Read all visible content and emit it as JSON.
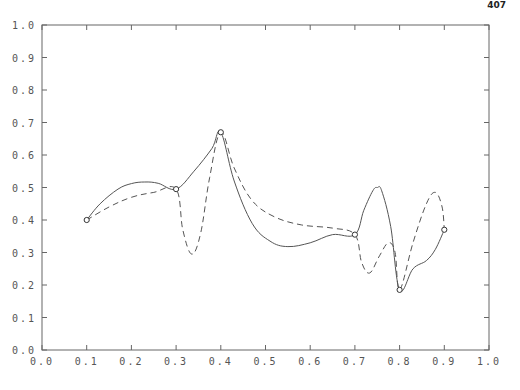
{
  "page": {
    "number": "407"
  },
  "chart_data": {
    "type": "line",
    "title": "",
    "xlabel": "",
    "ylabel": "",
    "xlim": [
      0.0,
      1.0
    ],
    "ylim": [
      0.0,
      1.0
    ],
    "grid": false,
    "legend": "none",
    "x_ticks": [
      "0.0",
      "0.1",
      "0.2",
      "0.3",
      "0.4",
      "0.5",
      "0.6",
      "0.7",
      "0.8",
      "0.9",
      "1.0"
    ],
    "y_ticks": [
      "0.0",
      "0.1",
      "0.2",
      "0.3",
      "0.4",
      "0.5",
      "0.6",
      "0.7",
      "0.8",
      "0.9",
      "1.0"
    ],
    "interpolation_points": {
      "name": "data points (circles)",
      "x": [
        0.1,
        0.3,
        0.4,
        0.7,
        0.8,
        0.9
      ],
      "y": [
        0.4,
        0.495,
        0.67,
        0.355,
        0.185,
        0.37
      ]
    },
    "series": [
      {
        "name": "solid curve",
        "style": "solid",
        "x": [
          0.1,
          0.13,
          0.17,
          0.2,
          0.23,
          0.26,
          0.3,
          0.34,
          0.38,
          0.4,
          0.43,
          0.47,
          0.51,
          0.55,
          0.6,
          0.65,
          0.7,
          0.72,
          0.74,
          0.75,
          0.76,
          0.78,
          0.8,
          0.83,
          0.86,
          0.88,
          0.9
        ],
        "y": [
          0.4,
          0.45,
          0.495,
          0.512,
          0.517,
          0.513,
          0.495,
          0.55,
          0.62,
          0.67,
          0.52,
          0.39,
          0.335,
          0.318,
          0.33,
          0.355,
          0.355,
          0.43,
          0.49,
          0.5,
          0.49,
          0.38,
          0.185,
          0.25,
          0.275,
          0.31,
          0.37
        ]
      },
      {
        "name": "dashed curve",
        "style": "dashed",
        "x": [
          0.1,
          0.15,
          0.2,
          0.25,
          0.3,
          0.315,
          0.335,
          0.355,
          0.375,
          0.4,
          0.43,
          0.47,
          0.52,
          0.58,
          0.65,
          0.7,
          0.715,
          0.733,
          0.755,
          0.775,
          0.79,
          0.8,
          0.83,
          0.86,
          0.88,
          0.895,
          0.9
        ],
        "y": [
          0.4,
          0.44,
          0.47,
          0.485,
          0.495,
          0.37,
          0.295,
          0.36,
          0.53,
          0.67,
          0.56,
          0.46,
          0.41,
          0.385,
          0.375,
          0.355,
          0.27,
          0.237,
          0.29,
          0.33,
          0.3,
          0.185,
          0.33,
          0.45,
          0.485,
          0.44,
          0.37
        ]
      }
    ]
  }
}
